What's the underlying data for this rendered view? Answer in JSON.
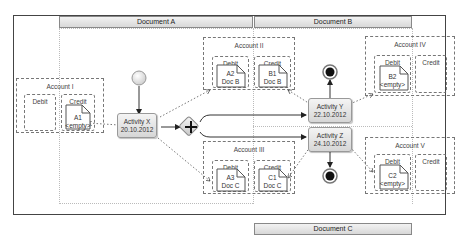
{
  "lanes": {
    "top": [
      "Document A",
      "Document B"
    ],
    "bottom": [
      "Document C"
    ]
  },
  "accounts": [
    {
      "id": "I",
      "title": "Account I",
      "debit_label": "Debit",
      "credit_label": "Credit",
      "credit_doc": {
        "line1": "A1",
        "line2": "<empty>"
      }
    },
    {
      "id": "II",
      "title": "Account II",
      "debit_label": "Debit",
      "credit_label": "Credit",
      "debit_doc": {
        "line1": "A2",
        "line2": "Doc B"
      },
      "credit_doc": {
        "line1": "B1",
        "line2": "Doc B"
      }
    },
    {
      "id": "III",
      "title": "Account III",
      "debit_label": "Debit",
      "credit_label": "Credit",
      "debit_doc": {
        "line1": "A3",
        "line2": "Doc C"
      },
      "credit_doc": {
        "line1": "C1",
        "line2": "Doc C"
      }
    },
    {
      "id": "IV",
      "title": "Account IV",
      "debit_label": "Debit",
      "credit_label": "Credit",
      "debit_doc": {
        "line1": "B2",
        "line2": "<empty>"
      }
    },
    {
      "id": "V",
      "title": "Account V",
      "debit_label": "Debit",
      "credit_label": "Credit",
      "debit_doc": {
        "line1": "C2",
        "line2": "<empty>"
      }
    }
  ],
  "activities": [
    {
      "id": "X",
      "name": "Activity  X",
      "date": "20.10.2012"
    },
    {
      "id": "Y",
      "name": "Activity  Y",
      "date": "22.10.2012"
    },
    {
      "id": "Z",
      "name": "Activity  Z",
      "date": "24.10.2012"
    }
  ],
  "gateway": {
    "type": "parallel",
    "symbol": "+"
  },
  "events": {
    "start": "start-event",
    "end": [
      "end-event-y",
      "end-event-z"
    ]
  }
}
